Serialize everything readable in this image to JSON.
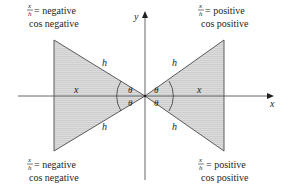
{
  "diagram": {
    "axes": {
      "x_label": "x",
      "y_label": "y"
    },
    "colors": {
      "ink": "#231f20",
      "fill": "#d4d4d4",
      "axis": "#4a4a4a"
    },
    "triangles": {
      "left": {
        "adjacent": "x",
        "hypotenuse_top": "h",
        "hypotenuse_bottom": "h",
        "angle_top": "θ",
        "angle_bottom": "θ"
      },
      "right": {
        "adjacent": "x",
        "hypotenuse_top": "h",
        "hypotenuse_bottom": "h",
        "angle_top": "θ",
        "angle_bottom": "θ"
      }
    },
    "quadrant_labels": {
      "top_left": {
        "frac_num": "x",
        "frac_den": "h",
        "ratio": "= negative",
        "cos": "cos negative"
      },
      "top_right": {
        "frac_num": "x",
        "frac_den": "h",
        "ratio": "= positive",
        "cos": "cos positive"
      },
      "bottom_left": {
        "frac_num": "x",
        "frac_den": "h",
        "ratio": "= negative",
        "cos": "cos negative"
      },
      "bottom_right": {
        "frac_num": "x",
        "frac_den": "h",
        "ratio": "= positive",
        "cos": "cos positive"
      }
    }
  }
}
